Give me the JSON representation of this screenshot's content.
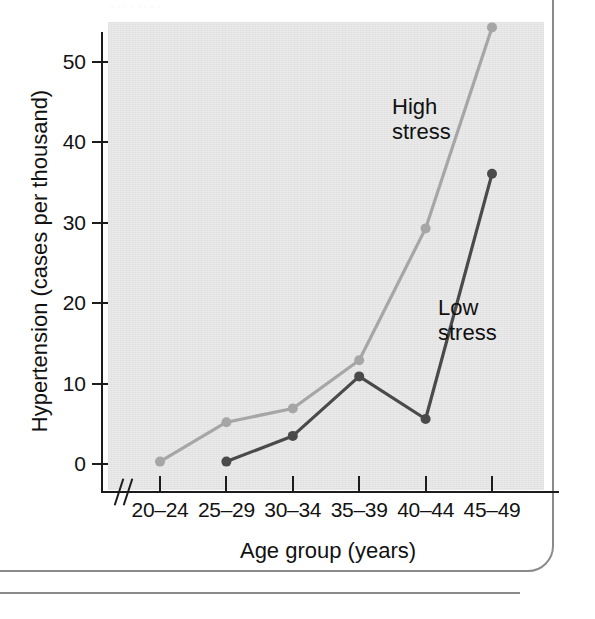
{
  "page": {
    "top_caption_remnant": "· · · · · · · ·"
  },
  "chart_data": {
    "type": "line",
    "title": "",
    "xlabel": "Age group (years)",
    "ylabel": "Hypertension (cases per thousand)",
    "categories": [
      "20–24",
      "25–29",
      "30–34",
      "35–39",
      "40–44",
      "45–49"
    ],
    "ylim": [
      0,
      55
    ],
    "yticks": [
      0,
      10,
      20,
      30,
      40,
      50
    ],
    "ytick_labels": [
      "0",
      "10",
      "20",
      "30",
      "40",
      "50"
    ],
    "grid": false,
    "x_axis_break": true,
    "legend_position": "inline-annotations",
    "series": [
      {
        "name": "High stress",
        "color": "#a6a6a6",
        "marker": "circle",
        "values": [
          0.3,
          5.2,
          6.9,
          12.9,
          29.3,
          54.3
        ]
      },
      {
        "name": "Low stress",
        "color": "#4a4a4a",
        "marker": "circle",
        "values": [
          null,
          0.3,
          3.5,
          10.9,
          5.6,
          36.1
        ]
      }
    ],
    "annotations": [
      {
        "text_line1": "High",
        "text_line2": "stress"
      },
      {
        "text_line1": "Low",
        "text_line2": "stress"
      }
    ]
  },
  "colors": {
    "plot_background": "#e4e4e4",
    "axis": "#1c1c1c",
    "high_stress": "#a6a6a6",
    "low_stress": "#4a4a4a",
    "frame": "#8b8b8b"
  }
}
